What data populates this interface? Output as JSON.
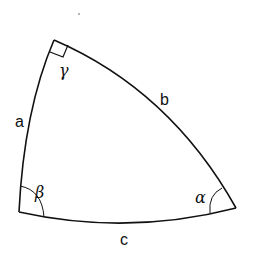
{
  "diagram": {
    "stroke_color": "#111111",
    "background": "#ffffff",
    "vertices": {
      "gamma": {
        "x": 54,
        "y": 40
      },
      "beta": {
        "x": 19,
        "y": 212
      },
      "alpha": {
        "x": 236,
        "y": 208
      }
    },
    "sides": {
      "a": "a",
      "b": "b",
      "c": "c"
    },
    "angles": {
      "alpha": "α",
      "beta": "β",
      "gamma": "γ"
    },
    "right_angle_at": "gamma"
  }
}
